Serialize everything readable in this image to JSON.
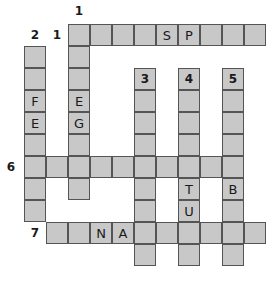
{
  "puzzle": {
    "cell_size": 22,
    "origin": {
      "x": 24,
      "y": 24
    },
    "colors": {
      "cell_fill": "#c8c8c8",
      "cell_border": "#555555",
      "text": "#1a1a1a"
    },
    "clue_numbers": [
      {
        "label": "1",
        "x": 72,
        "y": 4
      },
      {
        "label": "2",
        "x": 28,
        "y": 28
      },
      {
        "label": "1",
        "x": 50,
        "y": 28
      },
      {
        "label": "3",
        "x": 138,
        "y": 72
      },
      {
        "label": "4",
        "x": 182,
        "y": 72
      },
      {
        "label": "5",
        "x": 226,
        "y": 72
      },
      {
        "label": "6",
        "x": 4,
        "y": 160
      },
      {
        "label": "7",
        "x": 28,
        "y": 226
      }
    ],
    "words": [
      {
        "id": "1-across",
        "dir": "across",
        "row": 0,
        "col": 2,
        "letters": [
          "",
          "",
          "",
          "",
          "S",
          "P",
          "",
          "",
          ""
        ]
      },
      {
        "id": "1-down",
        "dir": "down",
        "row": 0,
        "col": 2,
        "letters": [
          "",
          "",
          "",
          "E",
          "G",
          "",
          "",
          ""
        ]
      },
      {
        "id": "2-down",
        "dir": "down",
        "row": 1,
        "col": 0,
        "letters": [
          "",
          "",
          "F",
          "E",
          "",
          "",
          "",
          ""
        ]
      },
      {
        "id": "3-down",
        "dir": "down",
        "row": 2,
        "col": 5,
        "letters": [
          "",
          "",
          "",
          "",
          "",
          "",
          "",
          "",
          ""
        ]
      },
      {
        "id": "4-down",
        "dir": "down",
        "row": 2,
        "col": 7,
        "letters": [
          "",
          "",
          "",
          "",
          "",
          "T",
          "U",
          "",
          ""
        ]
      },
      {
        "id": "5-down",
        "dir": "down",
        "row": 2,
        "col": 9,
        "letters": [
          "",
          "",
          "",
          "",
          "",
          "B",
          "",
          "",
          ""
        ]
      },
      {
        "id": "6-across",
        "dir": "across",
        "row": 6,
        "col": 0,
        "letters": [
          "",
          "",
          "",
          "",
          "",
          "",
          "",
          "",
          "",
          ""
        ]
      },
      {
        "id": "7-across",
        "dir": "across",
        "row": 9,
        "col": 1,
        "letters": [
          "",
          "",
          "N",
          "A",
          "",
          "",
          "",
          "",
          "",
          ""
        ]
      }
    ]
  }
}
